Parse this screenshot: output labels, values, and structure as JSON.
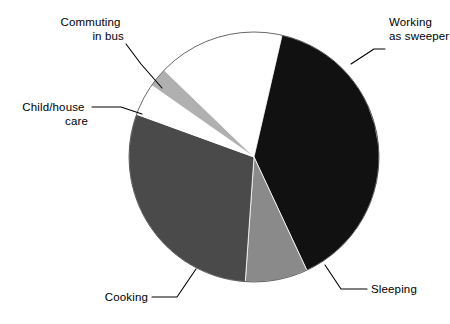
{
  "chart_data": {
    "type": "pie",
    "title": "",
    "subtitle": "",
    "xlabel": "",
    "ylabel": "",
    "legend_position": "none",
    "grid": false,
    "labels_shown": true,
    "categories": [
      "Working as sweeper",
      "Sleeping",
      "Cooking",
      "Child/house care",
      "Commuting in bus"
    ],
    "values": [
      39.5,
      8.0,
      29.5,
      4.0,
      2.5
    ],
    "unit": "percent",
    "slices": [
      {
        "label": "Working as sweeper",
        "value": 39.5,
        "color": "#111111",
        "start_angle_deg": -77,
        "end_angle_deg": 65
      },
      {
        "label": "Sleeping",
        "value": 8.0,
        "color": "#8a8a8a",
        "start_angle_deg": 65,
        "end_angle_deg": 94
      },
      {
        "label": "Cooking",
        "value": 29.5,
        "color": "#4a4a4a",
        "start_angle_deg": 94,
        "end_angle_deg": 200
      },
      {
        "label": "Child/house care",
        "value": 4.0,
        "color": "#ffffff",
        "start_angle_deg": 200,
        "end_angle_deg": 215
      },
      {
        "label": "Commuting in bus",
        "value": 2.5,
        "color": "#b0b0b0",
        "start_angle_deg": 215,
        "end_angle_deg": 224
      }
    ]
  },
  "labels": {
    "working": {
      "line1": "Working",
      "line2": "as sweeper"
    },
    "sleeping": {
      "line1": "Sleeping"
    },
    "cooking": {
      "line1": "Cooking"
    },
    "childcare": {
      "line1": "Child/house",
      "line2": "care"
    },
    "commuting": {
      "line1": "Commuting",
      "line2": "in bus"
    }
  },
  "geometry": {
    "center_x": 254,
    "center_y": 157,
    "radius": 125
  },
  "colors": {
    "background": "#ffffff",
    "text": "#000000",
    "leader_line": "#000000",
    "slice_working": "#111111",
    "slice_sleeping": "#8a8a8a",
    "slice_cooking": "#4a4a4a",
    "slice_childcare": "#ffffff",
    "slice_commuting": "#b0b0b0"
  }
}
